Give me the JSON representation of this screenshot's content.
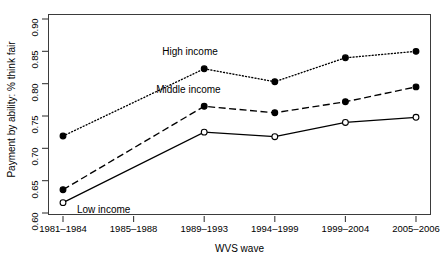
{
  "chart_data": {
    "type": "line",
    "title": "",
    "xlabel": "WVS wave",
    "ylabel": "Payment by ability: % think fair",
    "categories": [
      "1981–1984",
      "1985–1988",
      "1989–1993",
      "1994–1999",
      "1999–2004",
      "2005–2006"
    ],
    "ylim": [
      0.6,
      0.9
    ],
    "yticks": [
      "0.60",
      "0.65",
      "0.70",
      "0.75",
      "0.80",
      "0.85",
      "0.90"
    ],
    "ytick_values": [
      0.6,
      0.65,
      0.7,
      0.75,
      0.8,
      0.85,
      0.9
    ],
    "grid": false,
    "legend_position": "inline-annotations",
    "series": [
      {
        "name": "High income",
        "values": [
          0.719,
          null,
          0.823,
          0.803,
          0.84,
          0.85
        ],
        "linestyle": "dotted",
        "marker": "filled-circle",
        "color": "#000000",
        "label_x_index": 2,
        "label_dx": -42,
        "label_dy": -16
      },
      {
        "name": "Middle income",
        "values": [
          0.636,
          null,
          0.765,
          0.755,
          0.772,
          0.795
        ],
        "linestyle": "dashed",
        "marker": "filled-circle",
        "color": "#000000",
        "label_x_index": 2,
        "label_dx": -48,
        "label_dy": -15
      },
      {
        "name": "Low income",
        "values": [
          0.616,
          null,
          0.725,
          0.718,
          0.74,
          0.748
        ],
        "linestyle": "solid",
        "marker": "open-circle",
        "color": "#000000",
        "label_x_index": 0,
        "label_dx": 14,
        "label_dy": 8
      }
    ]
  },
  "axes": {
    "frame_color": "#3b3b3b",
    "tick_color": "#3b3b3b"
  }
}
